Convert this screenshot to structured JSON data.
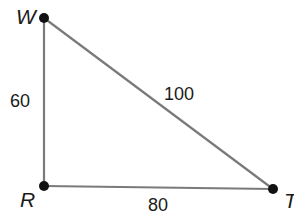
{
  "diagram": {
    "type": "right-triangle",
    "vertices": [
      {
        "name": "W",
        "x": 44,
        "y": 18
      },
      {
        "name": "R",
        "x": 44,
        "y": 186
      },
      {
        "name": "T",
        "x": 273,
        "y": 189
      }
    ],
    "sides": [
      {
        "from": "W",
        "to": "R",
        "length": "60"
      },
      {
        "from": "W",
        "to": "T",
        "length": "100"
      },
      {
        "from": "R",
        "to": "T",
        "length": "80"
      }
    ],
    "colors": {
      "line": "#7a7a7a",
      "point": "#111111",
      "text": "#1a1a1a"
    }
  }
}
